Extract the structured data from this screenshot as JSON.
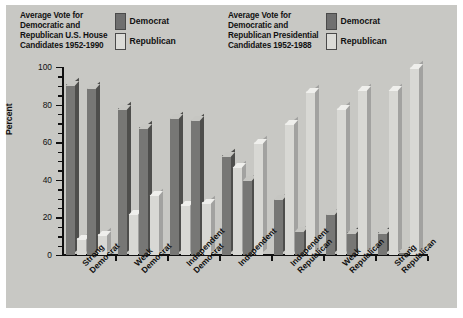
{
  "legends": [
    {
      "title": "Average Vote for\nDemocratic and\nRepublican U.S. House\nCandidates 1952-1990",
      "keys": [
        {
          "label": "Democrat",
          "color": "#6f6f6f"
        },
        {
          "label": "Republican",
          "color": "#dcdcd8"
        }
      ]
    },
    {
      "title": "Average Vote for\nDemocratic and\nRepublican Presidential\nCandidates 1952-1988",
      "keys": [
        {
          "label": "Democrat",
          "color": "#6f6f6f"
        },
        {
          "label": "Republican",
          "color": "#dcdcd8"
        }
      ]
    }
  ],
  "axis": {
    "ylabel": "Percent",
    "yticks": [
      "0",
      "20",
      "40",
      "60",
      "80",
      "100"
    ]
  },
  "categories_display": [
    "Strong\nDemocrat",
    "Weak\nDemocrat",
    "Independent\nDemocrat",
    "Independent",
    "Independent\nRepublican",
    "Weak\nRepublican",
    "Strong\nRepublican"
  ],
  "chart_data": {
    "type": "bar",
    "xlabel": "",
    "ylabel": "Percent",
    "ylim": [
      0,
      100
    ],
    "yticks": [
      0,
      20,
      40,
      60,
      80,
      100
    ],
    "grid": false,
    "legend_position": "top",
    "categories": [
      "Strong Democrat",
      "Weak Democrat",
      "Independent Democrat",
      "Independent",
      "Independent Republican",
      "Weak Republican",
      "Strong Republican"
    ],
    "series": [
      {
        "name": "Democrat (House 1952-1990)",
        "color": "#6f6f6f",
        "values": [
          91,
          78,
          73,
          53,
          30,
          22,
          12
        ]
      },
      {
        "name": "Republican (House 1952-1990)",
        "color": "#dcdcd8",
        "values": [
          9,
          22,
          27,
          47,
          70,
          78,
          88
        ]
      },
      {
        "name": "Democrat (Presidential 1952-1988)",
        "color": "#6f6f6f",
        "values": [
          89,
          68,
          72,
          40,
          13,
          12,
          2
        ]
      },
      {
        "name": "Republican (Presidential 1952-1988)",
        "color": "#dcdcd8",
        "values": [
          11,
          32,
          28,
          60,
          87,
          88,
          100
        ]
      }
    ]
  }
}
